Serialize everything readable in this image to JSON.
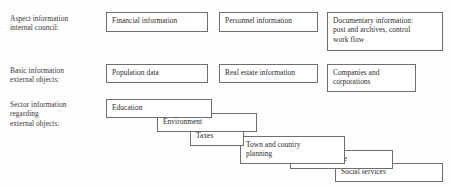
{
  "diagram": {
    "background_color": "#fdfdfd",
    "border_color": "#6e6e6e",
    "text_color": "#2b2b2b",
    "rows": [
      {
        "id": "aspect-information",
        "label": "Aspect information\ninternal council:",
        "boxes": [
          {
            "id": "financial-information",
            "text": "Financial information"
          },
          {
            "id": "personnel-information",
            "text": "Personnel information"
          },
          {
            "id": "documentary-information",
            "text": "Documentary information:\npost and archives, control\nwork flow"
          }
        ]
      },
      {
        "id": "basic-information",
        "label": "Basic information\nexternal objects:",
        "boxes": [
          {
            "id": "population-data",
            "text": "Population data"
          },
          {
            "id": "real-estate-information",
            "text": "Real estate information"
          },
          {
            "id": "companies-and-corporations",
            "text": "Companies and\ncorporations"
          }
        ]
      },
      {
        "id": "sector-information",
        "label": "Sector information\nregarding\nexternal objects:",
        "boxes": [
          {
            "id": "education",
            "text": "Education"
          },
          {
            "id": "environment",
            "text": "Environment"
          },
          {
            "id": "taxes",
            "text": "Taxes"
          },
          {
            "id": "town-and-country-planning",
            "text": "Town and country\nplanning"
          },
          {
            "id": "surveyors-office",
            "text": "Surveyor' soffice"
          },
          {
            "id": "social-services",
            "text": "Social services"
          }
        ]
      }
    ]
  }
}
